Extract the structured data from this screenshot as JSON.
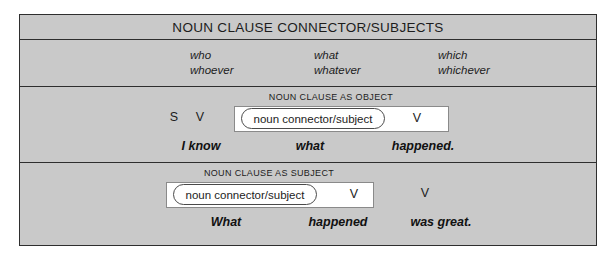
{
  "title": "NOUN CLAUSE CONNECTOR/SUBJECTS",
  "connector_words": {
    "columns": [
      {
        "top": "who",
        "bottom": "whoever"
      },
      {
        "top": "what",
        "bottom": "whatever"
      },
      {
        "top": "which",
        "bottom": "whichever"
      }
    ]
  },
  "object_section": {
    "caption": "NOUN CLAUSE AS OBJECT",
    "subject_label": "S",
    "verb_label": "V",
    "oval_label": "noun connector/subject",
    "box_verb_label": "V",
    "example": {
      "part1": "I know",
      "part2": "what",
      "part3": "happened."
    }
  },
  "subject_section": {
    "caption": "NOUN CLAUSE AS SUBJECT",
    "oval_label": "noun connector/subject",
    "box_verb_label": "V",
    "outer_verb_label": "V",
    "example": {
      "part1": "What",
      "part2": "happened",
      "part3": "was great."
    }
  },
  "colors": {
    "frame_border": "#2e2e2e",
    "cell_background": "#c9c9c9",
    "clause_box_background": "#ffffff",
    "clause_box_border": "#8a8a8a",
    "oval_border": "#4a4a4a"
  }
}
